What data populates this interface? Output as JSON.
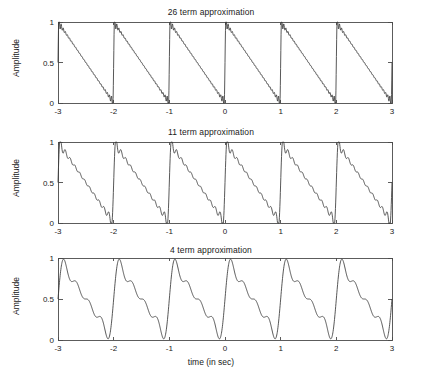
{
  "figure": {
    "background_color": "#ffffff",
    "line_color": "#3a3a3a",
    "axis_color": "#4a4a4a",
    "width": 422,
    "height": 377
  },
  "axis_label_x": "time (in sec)",
  "axis_label_y": "Amplitude",
  "chart_data": [
    {
      "type": "line",
      "title": "26 term approximation",
      "xlabel": "",
      "ylabel": "Amplitude",
      "xlim": [
        -3,
        3
      ],
      "ylim": [
        0,
        1
      ],
      "xticks": [
        -3,
        -2,
        -1,
        0,
        1,
        2,
        3
      ],
      "xticklabels": [
        "-3",
        "-2",
        "-1",
        "0",
        "1",
        "2",
        "3"
      ],
      "yticks": [
        0,
        0.5,
        1
      ],
      "yticklabels": [
        "0",
        "0.5",
        "1"
      ],
      "grid": false,
      "legend": "none",
      "series": [
        {
          "name": "26 term Fourier sawtooth",
          "terms": 26,
          "period": 1,
          "amplitude_peak": 0.92,
          "amplitude_trough": 0.09,
          "mean": 0.5,
          "description": "Fourier sine-series approximation of a falling sawtooth wave of period 1 s, 26 harmonics"
        }
      ]
    },
    {
      "type": "line",
      "title": "11 term approximation",
      "xlabel": "",
      "ylabel": "Amplitude",
      "xlim": [
        -3,
        3
      ],
      "ylim": [
        0,
        1
      ],
      "xticks": [
        -3,
        -2,
        -1,
        0,
        1,
        2,
        3
      ],
      "xticklabels": [
        "-3",
        "-2",
        "-1",
        "0",
        "1",
        "2",
        "3"
      ],
      "yticks": [
        0,
        0.5,
        1
      ],
      "yticklabels": [
        "0",
        "0.5",
        "1"
      ],
      "grid": false,
      "legend": "none",
      "series": [
        {
          "name": "11 term Fourier sawtooth",
          "terms": 11,
          "period": 1,
          "amplitude_peak": 0.87,
          "amplitude_trough": 0.16,
          "mean": 0.5,
          "description": "Fourier sine-series approximation of a falling sawtooth wave of period 1 s, 11 harmonics"
        }
      ]
    },
    {
      "type": "line",
      "title": "4 term approximation",
      "xlabel": "time (in sec)",
      "ylabel": "Amplitude",
      "xlim": [
        -3,
        3
      ],
      "ylim": [
        0,
        1
      ],
      "xticks": [
        -3,
        -2,
        -1,
        0,
        1,
        2,
        3
      ],
      "xticklabels": [
        "-3",
        "-2",
        "-1",
        "0",
        "1",
        "2",
        "3"
      ],
      "yticks": [
        0,
        0.5,
        1
      ],
      "yticklabels": [
        "0",
        "0.5",
        "1"
      ],
      "grid": false,
      "legend": "none",
      "series": [
        {
          "name": "4 term Fourier sawtooth",
          "terms": 4,
          "period": 1,
          "amplitude_peak": 0.95,
          "amplitude_trough": 0.04,
          "mean": 0.5,
          "description": "Fourier sine-series approximation of a falling sawtooth wave of period 1 s, 4 harmonics, visible ripple"
        }
      ]
    }
  ]
}
